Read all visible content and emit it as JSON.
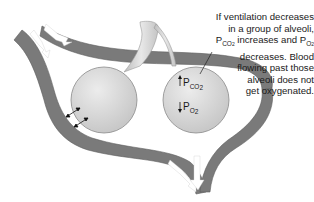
{
  "caption": {
    "lines": [
      "If ventilation decreases",
      "in a group of alveoli,",
      "increases and",
      "decreases. Blood",
      "flowing past those",
      "alveoli does not",
      "get oxygenated."
    ],
    "pco2_main": "P",
    "pco2_sub": "CO",
    "pco2_subsub": "2",
    "po2_main": "P",
    "po2_sub": "O",
    "po2_subsub": "2"
  },
  "alveolus_labels": {
    "pco2": {
      "arrow": "up",
      "main": "P",
      "sub": "CO2"
    },
    "po2": {
      "arrow": "down",
      "main": "P",
      "sub": "O2"
    }
  },
  "colors": {
    "vessel": "#7a7a7a",
    "vessel_edge": "#5e5e5e",
    "alveolus_fill": "#dcdcdc",
    "alveolus_edge": "#8a8a8a",
    "airway": "#d0d0d0",
    "flow_arrow": "#ffffff",
    "text": "#1a1a1a"
  }
}
